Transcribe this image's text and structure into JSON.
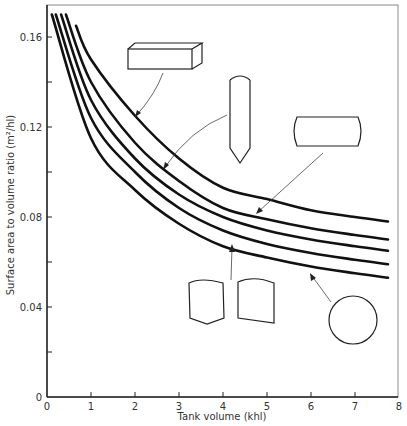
{
  "chart_data": {
    "type": "line",
    "title": "",
    "xlabel": "Tank volume (khl)",
    "ylabel": "Surface area to volume ratio (m²/hl)",
    "xlim": [
      0,
      8
    ],
    "ylim": [
      0,
      0.17
    ],
    "grid": false,
    "legend": "none (shapes with arrows label curves)",
    "x_ticks": [
      "0",
      "1",
      "2",
      "3",
      "4",
      "5",
      "6",
      "7",
      "8"
    ],
    "y_ticks": [
      "0",
      "0.04",
      "0.08",
      "0.12",
      "0.16"
    ],
    "y_minor_ticks": [
      0.02,
      0.06,
      0.1,
      0.14
    ],
    "series": [
      {
        "name": "Rectangular box tank",
        "x": [
          0.66,
          1.0,
          2.0,
          3.0,
          4.0,
          5.0,
          6.0,
          7.0,
          7.75
        ],
        "y": [
          0.165,
          0.15,
          0.125,
          0.106,
          0.093,
          0.088,
          0.083,
          0.08,
          0.078
        ]
      },
      {
        "name": "Vertical cylinder with conical base",
        "x": [
          0.43,
          1.0,
          2.0,
          3.0,
          4.0,
          5.0,
          6.0,
          7.0,
          7.75
        ],
        "y": [
          0.17,
          0.14,
          0.113,
          0.096,
          0.084,
          0.079,
          0.075,
          0.072,
          0.07
        ]
      },
      {
        "name": "Horizontal cylinder with dished ends",
        "x": [
          0.32,
          1.0,
          2.0,
          3.0,
          4.0,
          5.0,
          6.0,
          7.0,
          7.75
        ],
        "y": [
          0.17,
          0.132,
          0.106,
          0.09,
          0.08,
          0.074,
          0.07,
          0.067,
          0.065
        ]
      },
      {
        "name": "Vertical cylinders with dished tops",
        "x": [
          0.2,
          1.0,
          2.0,
          3.0,
          4.0,
          5.0,
          6.0,
          7.0,
          7.75
        ],
        "y": [
          0.17,
          0.124,
          0.1,
          0.084,
          0.074,
          0.068,
          0.064,
          0.061,
          0.059
        ]
      },
      {
        "name": "Sphere",
        "x": [
          0.11,
          1.0,
          2.0,
          3.0,
          4.0,
          5.0,
          6.0,
          7.0,
          7.75
        ],
        "y": [
          0.17,
          0.115,
          0.092,
          0.077,
          0.067,
          0.062,
          0.058,
          0.055,
          0.053
        ]
      }
    ],
    "annotations": [
      "box tank icon → top curve",
      "vertical cylinder with conical bottom icon → 2nd curve",
      "horizontal cylinder icon → 3rd curve",
      "two vertical cylinder icons → 4th curve",
      "circle (sphere) icon → bottom curve"
    ]
  }
}
